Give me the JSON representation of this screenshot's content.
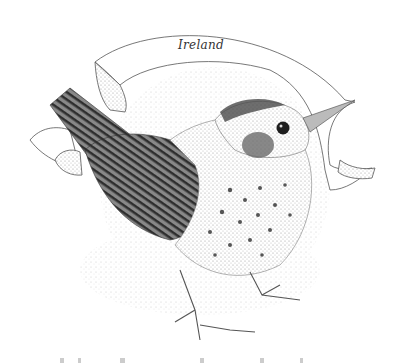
{
  "illustration": {
    "subject": "bird-engraving",
    "banner": {
      "text": "Ireland"
    },
    "colors": {
      "background": "#ffffff",
      "ink": "#2b2b2b",
      "stipple": "#9a9a9a",
      "light_stipple": "#cfcfcf"
    }
  }
}
